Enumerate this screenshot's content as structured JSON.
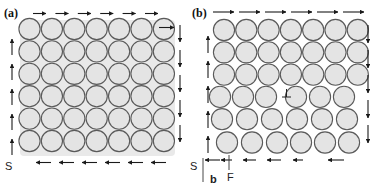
{
  "figure": {
    "panels": [
      {
        "id": "a",
        "label": "(a)",
        "description": "Perfect crystal with closed Burgers circuit",
        "start_label": "S",
        "lattice": {
          "cols": 7,
          "rows": 6,
          "dislocation": false
        },
        "circuit": {
          "top_arrows": 6,
          "right_arrows": 5,
          "bottom_arrows": 6,
          "left_arrows": 5,
          "closed": true
        }
      },
      {
        "id": "b",
        "label": "(b)",
        "description": "Crystal containing an edge dislocation with Burgers circuit failure",
        "start_label": "S",
        "finish_label": "F",
        "burgers_vector_label": "b",
        "dislocation_symbol": "⊥",
        "lattice": {
          "cols_upper": 7,
          "cols_lower": 6,
          "rows": 6,
          "dislocation": true
        },
        "circuit": {
          "top_arrows": 6,
          "right_arrows": 5,
          "bottom_arrows": 6,
          "left_arrows": 5,
          "closed": false
        }
      }
    ],
    "colors": {
      "atom_fill": "#e4e4e4",
      "atom_stroke": "#5a5a5a",
      "arrow": "#1a1a1a",
      "background": "#ffffff"
    }
  }
}
